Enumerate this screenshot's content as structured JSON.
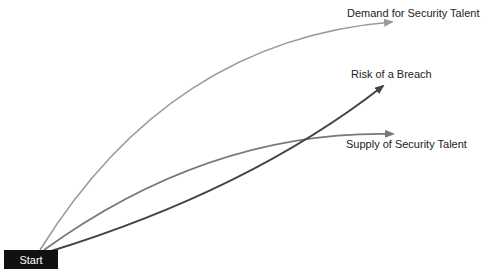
{
  "diagram": {
    "start": {
      "label": "Start",
      "bg": "#111111",
      "color": "#ffffff"
    },
    "curves": [
      {
        "id": "demand",
        "label": "Demand for Security Talent",
        "color": "#9a9a9a"
      },
      {
        "id": "risk",
        "label": "Risk of a Breach",
        "color": "#444444"
      },
      {
        "id": "supply",
        "label": "Supply of Security Talent",
        "color": "#777777"
      }
    ]
  }
}
